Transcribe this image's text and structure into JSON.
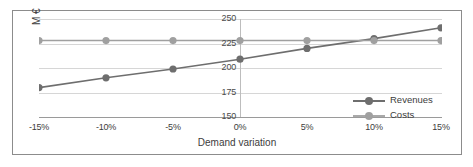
{
  "chart_data": {
    "type": "line",
    "title": "",
    "xlabel": "Demand variation",
    "ylabel": "M €",
    "categories": [
      "-15%",
      "-10%",
      "-5%",
      "0%",
      "5%",
      "10%",
      "15%"
    ],
    "x_values": [
      -15,
      -10,
      -5,
      0,
      5,
      10,
      15
    ],
    "ylim": [
      150,
      250
    ],
    "yticks": [
      150,
      175,
      200,
      225,
      250
    ],
    "ytick_labels": [
      "150",
      "175",
      "200",
      "225",
      "250"
    ],
    "grid": true,
    "legend_position": "center-right",
    "series": [
      {
        "name": "Revenues",
        "color": "#6e6e6e",
        "marker": "circle",
        "values": [
          180,
          190,
          199,
          209,
          220,
          230,
          241
        ]
      },
      {
        "name": "Costs",
        "color": "#a0a0a0",
        "marker": "circle",
        "values": [
          228,
          228,
          228,
          228,
          228,
          228,
          228
        ]
      }
    ]
  },
  "legend": {
    "items": [
      {
        "label": "Revenues"
      },
      {
        "label": "Costs"
      }
    ]
  },
  "axes": {
    "y_title": "M €",
    "x_title": "Demand variation"
  },
  "colors": {
    "revenues": "#6e6e6e",
    "costs": "#a0a0a0",
    "gridline": "#d6d6d6",
    "axis": "#9a9a9a",
    "border": "#8c8c8c",
    "text": "#3c3c3c",
    "background": "#ffffff"
  }
}
